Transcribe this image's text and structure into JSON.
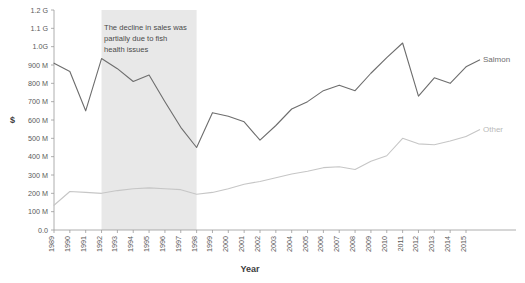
{
  "chart_data": {
    "type": "line",
    "title": "",
    "xlabel": "Year",
    "ylabel": "$",
    "x": [
      1989,
      1990,
      1991,
      1992,
      1993,
      1994,
      1995,
      1996,
      1997,
      1998,
      1999,
      2000,
      2001,
      2002,
      2003,
      2004,
      2005,
      2006,
      2007,
      2008,
      2009,
      2010,
      2011,
      2012,
      2013,
      2014,
      2015
    ],
    "xtick_labels": [
      "1989",
      "1990",
      "1991",
      "1992",
      "1993",
      "1994",
      "1995",
      "1996",
      "1997",
      "1998",
      "1999",
      "2000",
      "2001",
      "2002",
      "2003",
      "2004",
      "2005",
      "2006",
      "2007",
      "2008",
      "2009",
      "2010",
      "2011",
      "2012",
      "2013",
      "2014",
      "2015"
    ],
    "ytick_labels": [
      "0.0",
      "100 M",
      "200 M",
      "300 M",
      "400 M",
      "500 M",
      "600 M",
      "700 M",
      "800 M",
      "900 M",
      "1.0G",
      "1.1 G",
      "1.2 G"
    ],
    "ytick_values": [
      0,
      100000000,
      200000000,
      300000000,
      400000000,
      500000000,
      600000000,
      700000000,
      800000000,
      900000000,
      1000000000,
      1100000000,
      1200000000
    ],
    "ylim": [
      0,
      1200000000
    ],
    "grid": false,
    "legend_position": "right-inline",
    "series": [
      {
        "name": "Salmon",
        "color": "#6d6d6d",
        "values": [
          910000000,
          865000000,
          650000000,
          935000000,
          880000000,
          810000000,
          845000000,
          700000000,
          560000000,
          450000000,
          640000000,
          620000000,
          590000000,
          490000000,
          570000000,
          660000000,
          700000000,
          760000000,
          790000000,
          760000000,
          855000000,
          940000000,
          1020000000,
          730000000,
          830000000,
          800000000,
          890000000
        ]
      },
      {
        "name": "Other",
        "color": "#c6c6c6",
        "values": [
          135000000,
          210000000,
          205000000,
          200000000,
          215000000,
          225000000,
          230000000,
          225000000,
          220000000,
          195000000,
          205000000,
          225000000,
          250000000,
          265000000,
          285000000,
          305000000,
          320000000,
          340000000,
          345000000,
          330000000,
          375000000,
          405000000,
          500000000,
          470000000,
          465000000,
          485000000,
          510000000
        ]
      }
    ],
    "annotations": [
      {
        "text_lines": [
          "The decline in sales was",
          "partially due to fish",
          "health issues"
        ],
        "band_start_year": 1992,
        "band_end_year": 1998,
        "band_color": "#e8e8e8"
      }
    ]
  }
}
